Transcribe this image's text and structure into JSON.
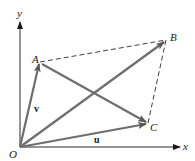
{
  "diagram": {
    "type": "vector-parallelogram",
    "colors": {
      "axis": "#2a2a2a",
      "vector": "#6e6e6e",
      "dashed": "#2a2a2a",
      "text": "#1a1a1a"
    },
    "axes": {
      "x_label": "x",
      "y_label": "y",
      "origin_label": "O"
    },
    "points": {
      "A": "A",
      "B": "B",
      "C": "C"
    },
    "vectors": {
      "u": "u",
      "v": "v"
    },
    "edges": [
      {
        "from": "O",
        "to": "A",
        "style": "solid-arrow",
        "name": "v"
      },
      {
        "from": "O",
        "to": "C",
        "style": "solid-arrow",
        "name": "u"
      },
      {
        "from": "O",
        "to": "B",
        "style": "solid-arrow",
        "name": "u+v"
      },
      {
        "from": "A",
        "to": "C",
        "style": "solid-arrow",
        "name": "u-v"
      },
      {
        "from": "A",
        "to": "B",
        "style": "dashed"
      },
      {
        "from": "C",
        "to": "B",
        "style": "dashed"
      }
    ]
  }
}
